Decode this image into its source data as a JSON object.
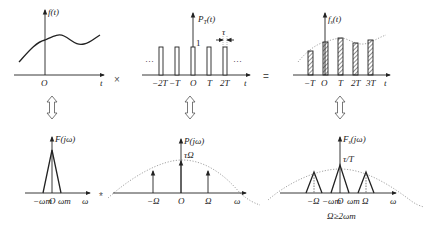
{
  "diagram": {
    "operators": {
      "multiply": "×",
      "equals": "=",
      "convolve": "*"
    },
    "top_row": {
      "panel1": {
        "ylabel": "f(t)",
        "xlabel": "t",
        "origin": "O"
      },
      "panel2": {
        "ylabel": "PT(t)",
        "ylabel_main": "P",
        "ylabel_sub": "T",
        "ylabel_arg": "(t)",
        "xlabel": "t",
        "height_label": "1",
        "width_label": "τ",
        "ellipsis": "···",
        "ticks": [
          "−2T",
          "−T",
          "O",
          "T",
          "2T"
        ]
      },
      "panel3": {
        "ylabel": "fs(t)",
        "ylabel_main": "f",
        "ylabel_sub": "s",
        "ylabel_arg": "(t)",
        "xlabel": "t",
        "ticks": [
          "−T",
          "O",
          "T",
          "2T",
          "3T"
        ]
      }
    },
    "bottom_row": {
      "panel1": {
        "ylabel": "F(jω)",
        "xlabel": "ω",
        "ticks": [
          "−ωm",
          "O",
          "ωm"
        ]
      },
      "panel2": {
        "ylabel": "P(jω)",
        "xlabel": "ω",
        "peak_label": "τΩ",
        "ticks": [
          "−Ω",
          "O",
          "Ω"
        ]
      },
      "panel3": {
        "ylabel": "Fs(jω)",
        "ylabel_main": "F",
        "ylabel_sub": "s",
        "ylabel_arg": "(jω)",
        "xlabel": "ω",
        "peak_label": "τ/T",
        "ticks": [
          "−Ω",
          "−ωm",
          "O",
          "ωm",
          "Ω"
        ],
        "condition": "Ω≥2ωm"
      }
    },
    "transform_arrows": [
      "fourier-pair-1",
      "fourier-pair-2",
      "fourier-pair-3"
    ]
  }
}
